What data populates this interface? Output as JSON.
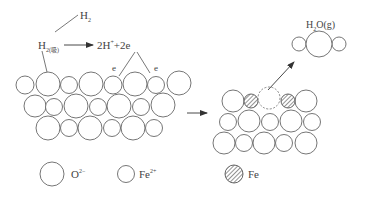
{
  "colors": {
    "stroke": "#555555",
    "fill": "#ffffff",
    "hatch": "#777777",
    "text": "#444444"
  },
  "labels": {
    "h2_gas": {
      "base": "H",
      "sub": "2"
    },
    "h2_adsorbed": {
      "base": "H",
      "sub": "2(吸)"
    },
    "reaction_product": {
      "text": "2H",
      "sup": "+",
      "tail": "+2e"
    },
    "electron_1": "e",
    "electron_2": "e",
    "water_gas": {
      "base": "H",
      "sub": "2",
      "tail": "O(g)"
    }
  },
  "legend": [
    {
      "symbol": "large-open-circle",
      "label": "O",
      "sup": "2−"
    },
    {
      "symbol": "small-open-circle",
      "label": "Fe",
      "sup": "2+"
    },
    {
      "symbol": "hatched-circle",
      "label": "Fe",
      "sup": ""
    }
  ]
}
